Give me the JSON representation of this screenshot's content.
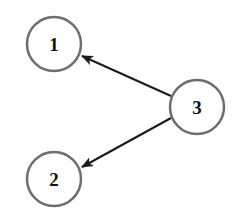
{
  "diagram": {
    "type": "directed-graph",
    "nodes": [
      {
        "id": "1",
        "label": "1",
        "cx": 54,
        "cy": 44
      },
      {
        "id": "2",
        "label": "2",
        "cx": 54,
        "cy": 179
      },
      {
        "id": "3",
        "label": "3",
        "cx": 197,
        "cy": 107
      }
    ],
    "edges": [
      {
        "from": "3",
        "to": "1"
      },
      {
        "from": "3",
        "to": "2"
      }
    ],
    "colors": {
      "node_stroke": "#6e6e6e",
      "edge": "#1a1a1a",
      "label": "#111111",
      "background": "#ffffff"
    }
  }
}
